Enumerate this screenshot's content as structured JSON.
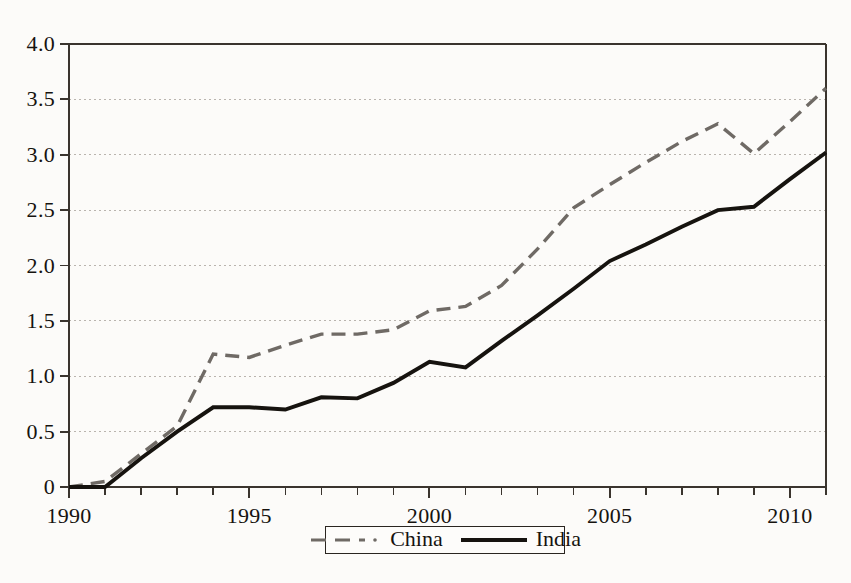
{
  "chart_data": {
    "type": "line",
    "title": "",
    "subtitle": "",
    "xlabel": "",
    "ylabel": "",
    "xlim": [
      1990,
      2011
    ],
    "ylim": [
      0,
      4.0
    ],
    "grid": true,
    "grid_axis": "y",
    "legend_position": "bottom-center",
    "x": [
      1990,
      1991,
      1992,
      1993,
      1994,
      1995,
      1996,
      1997,
      1998,
      1999,
      2000,
      2001,
      2002,
      2003,
      2004,
      2005,
      2006,
      2007,
      2008,
      2009,
      2010,
      2011
    ],
    "xticks": [
      1990,
      1995,
      2000,
      2005,
      2010
    ],
    "xtick_labels": [
      "1990",
      "1995",
      "2000",
      "2005",
      "2010"
    ],
    "yticks": [
      0,
      0.5,
      1.0,
      1.5,
      2.0,
      2.5,
      3.0,
      3.5,
      4.0
    ],
    "ytick_labels": [
      "0",
      "0.5",
      "1.0",
      "1.5",
      "2.0",
      "2.5",
      "3.0",
      "3.5",
      "4.0"
    ],
    "series": [
      {
        "name": "China",
        "style": "dashed",
        "color": "#6f6a65",
        "values": [
          0.0,
          0.05,
          0.3,
          0.55,
          1.2,
          1.17,
          1.28,
          1.38,
          1.38,
          1.42,
          1.59,
          1.63,
          1.82,
          2.15,
          2.52,
          2.73,
          2.93,
          3.12,
          3.28,
          3.01,
          3.3,
          3.6
        ]
      },
      {
        "name": "India",
        "style": "solid",
        "color": "#16130f",
        "values": [
          0.0,
          0.0,
          0.26,
          0.5,
          0.72,
          0.72,
          0.7,
          0.81,
          0.8,
          0.94,
          1.13,
          1.08,
          1.32,
          1.55,
          1.79,
          2.04,
          2.19,
          2.35,
          2.5,
          2.53,
          2.78,
          3.02
        ]
      }
    ]
  },
  "legend": {
    "entries": [
      {
        "label": "China",
        "style": "dashed"
      },
      {
        "label": "India",
        "style": "solid"
      }
    ]
  },
  "colors": {
    "background": "#fcfbf9",
    "axis": "#3a342e",
    "grid": "#b9b4ae",
    "china": "#6f6a65",
    "india": "#16130f",
    "text": "#16130f"
  }
}
